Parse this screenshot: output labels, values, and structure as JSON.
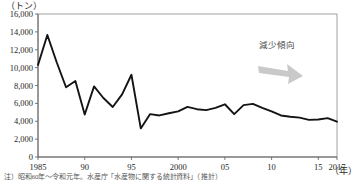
{
  "chart_data": {
    "type": "line",
    "title": "",
    "xlabel": "(年)",
    "ylabel": "(トン)",
    "y_unit_label": "（トン）",
    "x_unit_label": "（年）",
    "xlim": [
      1985,
      2017
    ],
    "ylim": [
      0,
      16000
    ],
    "y_ticks": [
      0,
      2000,
      4000,
      6000,
      8000,
      10000,
      12000,
      14000,
      16000
    ],
    "y_tick_labels": [
      "0",
      "2,000",
      "4,000",
      "6,000",
      "8,000",
      "10,000",
      "12,000",
      "14,000",
      "16,000"
    ],
    "x_ticks": [
      1985,
      1990,
      1995,
      2000,
      2005,
      2010,
      2015,
      2017
    ],
    "x_tick_labels": [
      "1985",
      "90",
      "95",
      "2000",
      "05",
      "10",
      "15",
      "2017"
    ],
    "grid": false,
    "legend": false,
    "series": [
      {
        "name": "漁獲量",
        "color": "#141414",
        "x": [
          1985,
          1986,
          1987,
          1988,
          1989,
          1990,
          1991,
          1992,
          1993,
          1994,
          1995,
          1996,
          1997,
          1998,
          1999,
          2000,
          2001,
          2002,
          2003,
          2004,
          2005,
          2006,
          2007,
          2008,
          2009,
          2010,
          2011,
          2012,
          2013,
          2014,
          2015,
          2016,
          2017
        ],
        "values": [
          10300,
          13650,
          10600,
          7800,
          8500,
          4750,
          7900,
          6600,
          5600,
          7000,
          9200,
          3200,
          4800,
          4650,
          4900,
          5100,
          5600,
          5350,
          5250,
          5500,
          5900,
          4800,
          5800,
          5950,
          5500,
          5100,
          4650,
          4500,
          4400,
          4150,
          4200,
          4350,
          3950
        ]
      }
    ],
    "annotations": [
      {
        "name": "trend-annotation",
        "text": "減少傾向",
        "arrow": "down-right-block-arrow",
        "color": "#c9c9c9"
      }
    ]
  },
  "caption": {
    "text": "注）昭和60年～令和元年。水産庁「水産物に関する統計資料」（推計）"
  }
}
